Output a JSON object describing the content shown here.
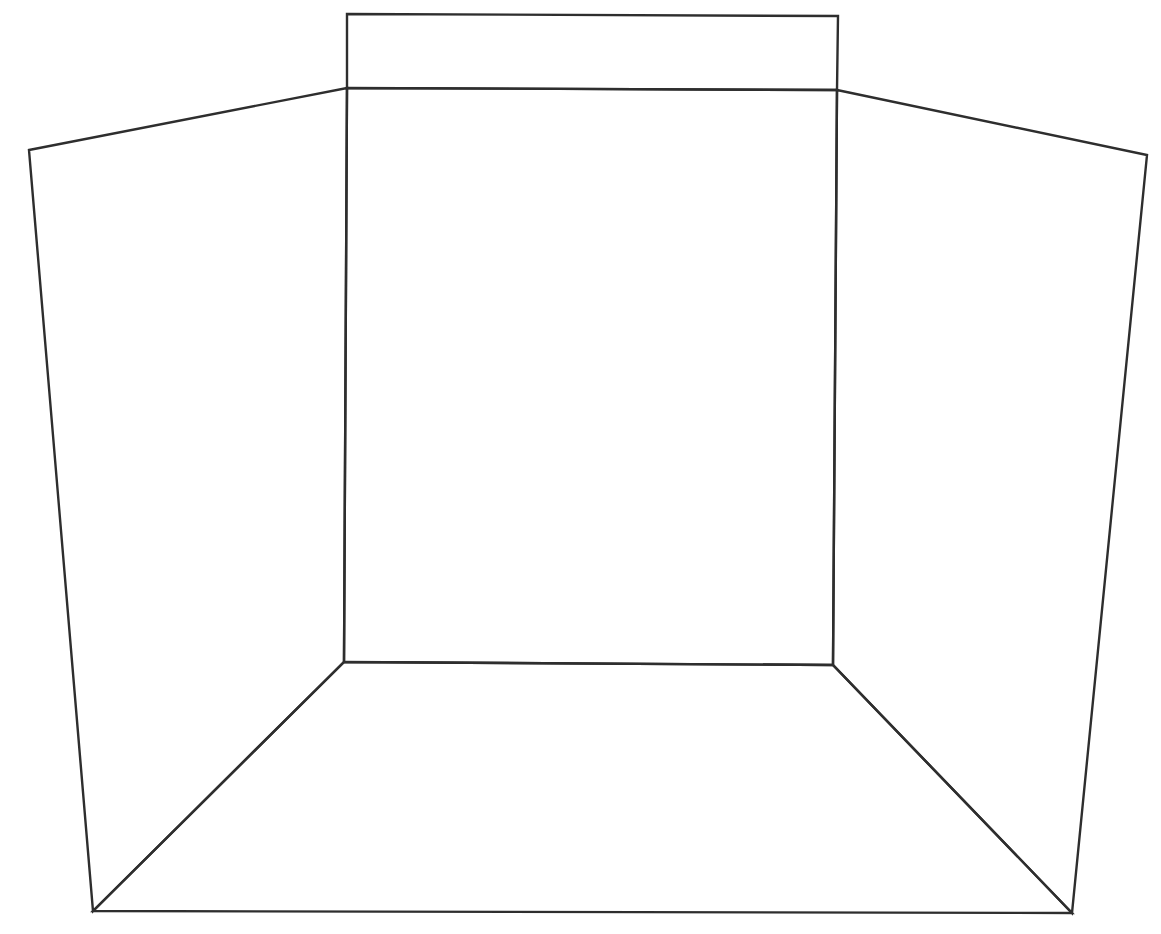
{
  "diagram": {
    "type": "perspective-room-line-drawing",
    "stroke_color": "#2e2e2e",
    "background": "#ffffff",
    "shapes": {
      "top_panel": [
        [
          347,
          14
        ],
        [
          838,
          16
        ],
        [
          837,
          90
        ],
        [
          347,
          88
        ]
      ],
      "back_wall": [
        [
          347,
          88
        ],
        [
          837,
          90
        ],
        [
          833,
          665
        ],
        [
          344,
          662
        ]
      ],
      "left_wall": [
        [
          29,
          150
        ],
        [
          347,
          88
        ],
        [
          344,
          662
        ],
        [
          93,
          911
        ]
      ],
      "right_wall": [
        [
          837,
          90
        ],
        [
          1147,
          155
        ],
        [
          1072,
          913
        ],
        [
          833,
          665
        ]
      ],
      "floor": [
        [
          344,
          662
        ],
        [
          833,
          665
        ],
        [
          1072,
          913
        ],
        [
          93,
          911
        ]
      ]
    }
  }
}
